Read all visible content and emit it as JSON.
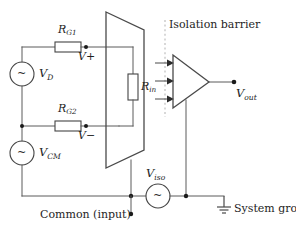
{
  "figure": {
    "kind": "circuit-diagram",
    "title_text": "Isolation barrier",
    "background_color": "#ffffff",
    "line_color": "#4a4a4a",
    "text_color": "#1e1e1e"
  },
  "labels": {
    "r_g1": {
      "base": "R",
      "sub": "G1"
    },
    "r_g2": {
      "base": "R",
      "sub": "G2"
    },
    "r_in": {
      "base": "R",
      "sub": "in"
    },
    "v_d": {
      "base": "V",
      "sub": "D"
    },
    "v_cm": {
      "base": "V",
      "sub": "CM"
    },
    "v_iso": {
      "base": "V",
      "sub": "iso"
    },
    "v_out": {
      "base": "V",
      "sub": "out"
    },
    "v_plus": "V+",
    "v_minus": "V−",
    "isolation_barrier": "Isolation barrier",
    "common_input": "Common (input)",
    "system_ground": "System ground"
  },
  "components": {
    "sources": [
      {
        "name": "v-d-source",
        "symbol": "~",
        "label": "V_D"
      },
      {
        "name": "v-cm-source",
        "symbol": "~",
        "label": "V_CM"
      },
      {
        "name": "v-iso-source",
        "symbol": "~",
        "label": "V_iso"
      }
    ],
    "resistors": [
      {
        "name": "r-g1-resistor",
        "label": "R_G1",
        "orientation": "horizontal"
      },
      {
        "name": "r-g2-resistor",
        "label": "R_G2",
        "orientation": "horizontal"
      },
      {
        "name": "r-in-resistor",
        "label": "R_in",
        "orientation": "vertical"
      }
    ],
    "amplifier": {
      "name": "isolation-amplifier",
      "inputs": 3,
      "output_label": "V_out"
    },
    "input_stage": {
      "name": "input-stage-parallelogram"
    },
    "ground": {
      "name": "system-ground-symbol"
    }
  }
}
